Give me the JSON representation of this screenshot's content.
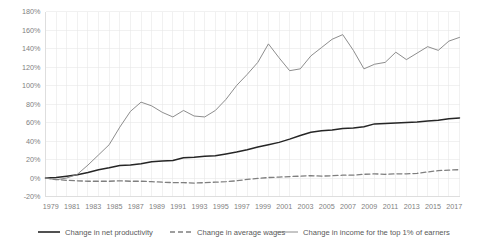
{
  "chart_data": {
    "type": "line",
    "title": "",
    "subtitle": "",
    "xlabel": "",
    "ylabel": "",
    "grid": true,
    "legend_position": "bottom",
    "ylim": [
      -20,
      180
    ],
    "ytick_labels": [
      "180%",
      "160%",
      "140%",
      "120%",
      "100%",
      "80%",
      "60%",
      "40%",
      "20%",
      "0%",
      "-20%"
    ],
    "ytick_values": [
      180,
      160,
      140,
      120,
      100,
      80,
      60,
      40,
      20,
      0,
      -20
    ],
    "xlim": [
      1979,
      2018
    ],
    "x": [
      1979,
      1980,
      1981,
      1982,
      1983,
      1984,
      1985,
      1986,
      1987,
      1988,
      1989,
      1990,
      1991,
      1992,
      1993,
      1994,
      1995,
      1996,
      1997,
      1998,
      1999,
      2000,
      2001,
      2002,
      2003,
      2004,
      2005,
      2006,
      2007,
      2008,
      2009,
      2010,
      2011,
      2012,
      2013,
      2014,
      2015,
      2016,
      2017,
      2018
    ],
    "xtick_labels": [
      "1979",
      "1981",
      "1983",
      "1985",
      "1987",
      "1989",
      "1991",
      "1993",
      "1995",
      "1997",
      "1999",
      "2001",
      "2003",
      "2005",
      "2007",
      "2009",
      "2011",
      "2013",
      "2015",
      "2017"
    ],
    "xtick_values": [
      1979,
      1981,
      1983,
      1985,
      1987,
      1989,
      1991,
      1993,
      1995,
      1997,
      1999,
      2001,
      2003,
      2005,
      2007,
      2009,
      2011,
      2013,
      2015,
      2017
    ],
    "series": [
      {
        "name": "Change in net productivity",
        "style": "solid",
        "color": "#262626",
        "width": 1.5,
        "values": [
          0,
          0.5,
          2,
          3.5,
          6,
          9,
          11,
          13.5,
          14,
          15.5,
          17.5,
          18.5,
          19,
          22,
          22.5,
          23.5,
          24,
          26,
          28,
          30.5,
          33.5,
          36,
          38.5,
          42,
          46,
          49.5,
          51,
          52,
          53.5,
          54,
          55.5,
          58.5,
          59,
          59.5,
          60,
          60.5,
          61.5,
          62.5,
          64,
          65
        ]
      },
      {
        "name": "Change in average wages",
        "style": "dashed",
        "color": "#7f7f7f",
        "width": 1.3,
        "values": [
          0,
          -1.5,
          -2.5,
          -3,
          -3.5,
          -3.5,
          -3.5,
          -3,
          -3.5,
          -3.5,
          -4,
          -4.5,
          -5,
          -5,
          -5.5,
          -5,
          -4.5,
          -4,
          -3,
          -1.5,
          -0.5,
          0.5,
          1,
          1.5,
          2,
          2.5,
          2,
          2.5,
          3,
          3,
          4,
          4.5,
          4,
          4.5,
          4.5,
          5,
          6.5,
          8,
          8.5,
          9
        ]
      },
      {
        "name": "Change in income for the top 1% of earners",
        "style": "solid",
        "color": "#808080",
        "width": 0.9,
        "values": [
          0,
          -2,
          0,
          4,
          14,
          25,
          36,
          55,
          72,
          82,
          78,
          71,
          66,
          73,
          67,
          66,
          73,
          85,
          100,
          112,
          125,
          145,
          130,
          116,
          118,
          132,
          141,
          150,
          155,
          138,
          118,
          123,
          125,
          136,
          128,
          135,
          142,
          138,
          148,
          152
        ]
      }
    ],
    "legend": [
      {
        "label": "Change in net productivity",
        "style": "solid",
        "color": "#262626",
        "width": 1.6
      },
      {
        "label": "Change in average wages",
        "style": "dashed",
        "color": "#7f7f7f",
        "width": 1.4
      },
      {
        "label": "Change in income for the top 1% of earners",
        "style": "solid",
        "color": "#808080",
        "width": 0.9
      }
    ]
  }
}
